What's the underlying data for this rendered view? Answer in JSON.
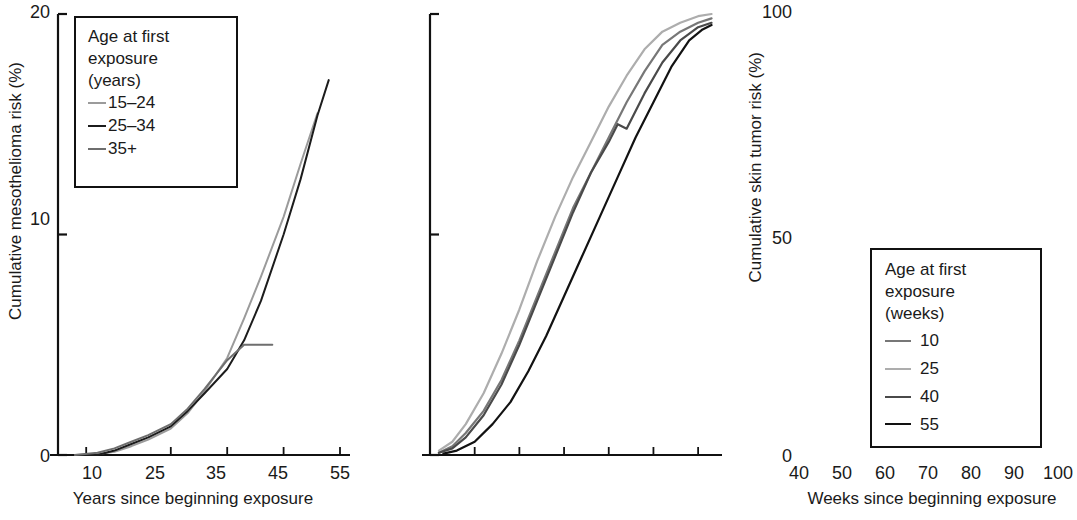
{
  "figure": {
    "background": "#ffffff",
    "panels": [
      "left",
      "right"
    ]
  },
  "left_panel": {
    "ylabel": "Cumulative mesothelioma risk (%)",
    "xlabel": "Years since beginning exposure",
    "yticks": [
      "0",
      "10",
      "20"
    ],
    "xticks": [
      "10",
      "25",
      "35",
      "45",
      "55"
    ],
    "legend": {
      "title_line1": "Age at first",
      "title_line2": "exposure",
      "title_line3": "(years)",
      "entries": [
        {
          "label": "15–24",
          "color": "#9b9b9b"
        },
        {
          "label": "25–34",
          "color": "#1c1c1c"
        },
        {
          "label": "35+",
          "color": "#6e6e6e"
        }
      ]
    }
  },
  "right_panel": {
    "ylabel": "Cumulative skin tumor risk (%)",
    "xlabel": "Weeks since beginning exposure",
    "yticks": [
      "0",
      "50",
      "100"
    ],
    "xticks": [
      "40",
      "50",
      "60",
      "70",
      "80",
      "90",
      "100"
    ],
    "legend": {
      "title_line1": "Age at first",
      "title_line2": "exposure",
      "title_line3": "(weeks)",
      "entries": [
        {
          "label": "10",
          "color": "#777777"
        },
        {
          "label": "25",
          "color": "#adadad"
        },
        {
          "label": "40",
          "color": "#4a4a4a"
        },
        {
          "label": "55",
          "color": "#121212"
        }
      ]
    }
  },
  "chart_data": [
    {
      "type": "line",
      "panel": "left",
      "title": "",
      "xlabel": "Years since beginning exposure",
      "ylabel": "Cumulative mesothelioma risk (%)",
      "xlim": [
        5,
        55
      ],
      "ylim": [
        0,
        20
      ],
      "xticks": [
        10,
        25,
        35,
        45,
        55
      ],
      "yticks": [
        0,
        10,
        20
      ],
      "grid": false,
      "legend_position": "upper-left",
      "legend_title": "Age at first exposure (years)",
      "series": [
        {
          "name": "15–24",
          "color": "#9b9b9b",
          "x": [
            8,
            12,
            15,
            18,
            21,
            25,
            28,
            31,
            35,
            38,
            41,
            45,
            48,
            51
          ],
          "y": [
            0.0,
            0.05,
            0.15,
            0.4,
            0.7,
            1.2,
            1.9,
            2.9,
            4.4,
            6.2,
            8.1,
            10.8,
            13.2,
            15.5
          ]
        },
        {
          "name": "25–34",
          "color": "#1c1c1c",
          "x": [
            8,
            12,
            15,
            18,
            21,
            25,
            28,
            31,
            35,
            38,
            41,
            45,
            48,
            51,
            53
          ],
          "y": [
            0.0,
            0.0,
            0.2,
            0.5,
            0.8,
            1.3,
            2.0,
            2.8,
            3.9,
            5.2,
            7.0,
            10.0,
            12.5,
            15.4,
            17.0
          ]
        },
        {
          "name": "35+",
          "color": "#6e6e6e",
          "x": [
            8,
            12,
            15,
            18,
            21,
            25,
            28,
            31,
            35,
            38,
            40,
            43
          ],
          "y": [
            0.0,
            0.1,
            0.3,
            0.6,
            0.9,
            1.4,
            2.1,
            3.0,
            4.3,
            5.0,
            5.0,
            5.0
          ]
        }
      ]
    },
    {
      "type": "line",
      "panel": "right",
      "title": "",
      "xlabel": "Weeks since beginning exposure",
      "ylabel": "Cumulative skin tumor risk (%)",
      "xlim": [
        40,
        104
      ],
      "ylim": [
        0,
        100
      ],
      "xticks": [
        40,
        50,
        60,
        70,
        80,
        90,
        100
      ],
      "yticks": [
        0,
        50,
        100
      ],
      "grid": false,
      "legend_position": "lower-right",
      "legend_title": "Age at first exposure (weeks)",
      "series": [
        {
          "name": "10",
          "color": "#777777",
          "x": [
            42,
            45,
            48,
            52,
            56,
            60,
            64,
            68,
            72,
            76,
            80,
            84,
            88,
            92,
            96,
            100,
            103
          ],
          "y": [
            0.5,
            2.0,
            5.0,
            10.0,
            17.0,
            26.0,
            36.0,
            46.0,
            56.0,
            64.0,
            72.0,
            80.0,
            87.0,
            93.0,
            96.0,
            98.0,
            99.0
          ]
        },
        {
          "name": "25",
          "color": "#adadad",
          "x": [
            42,
            45,
            48,
            52,
            56,
            60,
            64,
            68,
            72,
            76,
            80,
            84,
            88,
            92,
            96,
            100,
            103
          ],
          "y": [
            1.0,
            3.0,
            7.0,
            14.0,
            23.0,
            33.0,
            44.0,
            54.0,
            63.0,
            71.0,
            79.0,
            86.0,
            92.0,
            96.0,
            98.0,
            99.5,
            100.0
          ]
        },
        {
          "name": "40",
          "color": "#4a4a4a",
          "x": [
            42,
            45,
            48,
            52,
            56,
            60,
            64,
            68,
            72,
            76,
            80,
            82,
            84,
            88,
            92,
            96,
            100,
            103
          ],
          "y": [
            0.5,
            1.5,
            4.0,
            9.0,
            16.0,
            25.0,
            35.0,
            45.0,
            55.0,
            64.0,
            71.0,
            75.0,
            74.0,
            82.0,
            89.0,
            94.0,
            97.0,
            98.0
          ]
        },
        {
          "name": "55",
          "color": "#121212",
          "x": [
            43,
            46,
            50,
            54,
            58,
            62,
            66,
            70,
            74,
            78,
            82,
            86,
            90,
            94,
            98,
            101,
            103
          ],
          "y": [
            0.3,
            1.0,
            3.0,
            7.0,
            12.0,
            19.0,
            27.0,
            36.0,
            45.0,
            54.0,
            63.0,
            72.0,
            80.0,
            88.0,
            94.0,
            96.5,
            97.5
          ]
        }
      ]
    }
  ]
}
